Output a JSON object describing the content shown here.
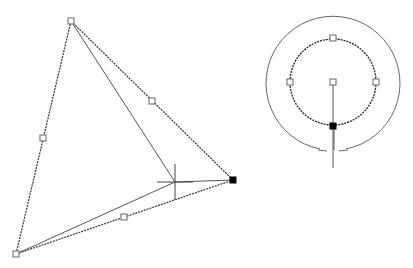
{
  "canvas": {
    "background": "#ffffff",
    "width": 413,
    "height": 268
  },
  "triangle": {
    "vertices": {
      "top": [
        71,
        21
      ],
      "right": [
        233,
        180
      ],
      "bottom_left": [
        16,
        254
      ]
    },
    "midpoint_grips": [
      [
        152,
        101
      ],
      [
        43,
        138
      ],
      [
        124,
        217
      ]
    ],
    "selected_grip": [
      233,
      180
    ]
  },
  "rubberband": {
    "from_top": [
      71,
      21
    ],
    "from_bottom_left": [
      16,
      254
    ],
    "to_cursor": [
      175,
      182
    ],
    "to_selected": [
      233,
      180
    ]
  },
  "crosshair": {
    "center": [
      175,
      182
    ],
    "half_width": 18,
    "half_height": 18
  },
  "circles": {
    "center": [
      333,
      82
    ],
    "outer_radius": 67,
    "inner_radius": 43,
    "inner_grips": [
      [
        333,
        38
      ],
      [
        290,
        82
      ],
      [
        376,
        82
      ],
      [
        333,
        82
      ]
    ],
    "selected_grip": [
      333,
      126
    ],
    "stem_end": [
      333,
      168
    ]
  },
  "colors": {
    "grip_fill": "#ffffff",
    "grip_hot": "#000000",
    "line": "#555555"
  }
}
